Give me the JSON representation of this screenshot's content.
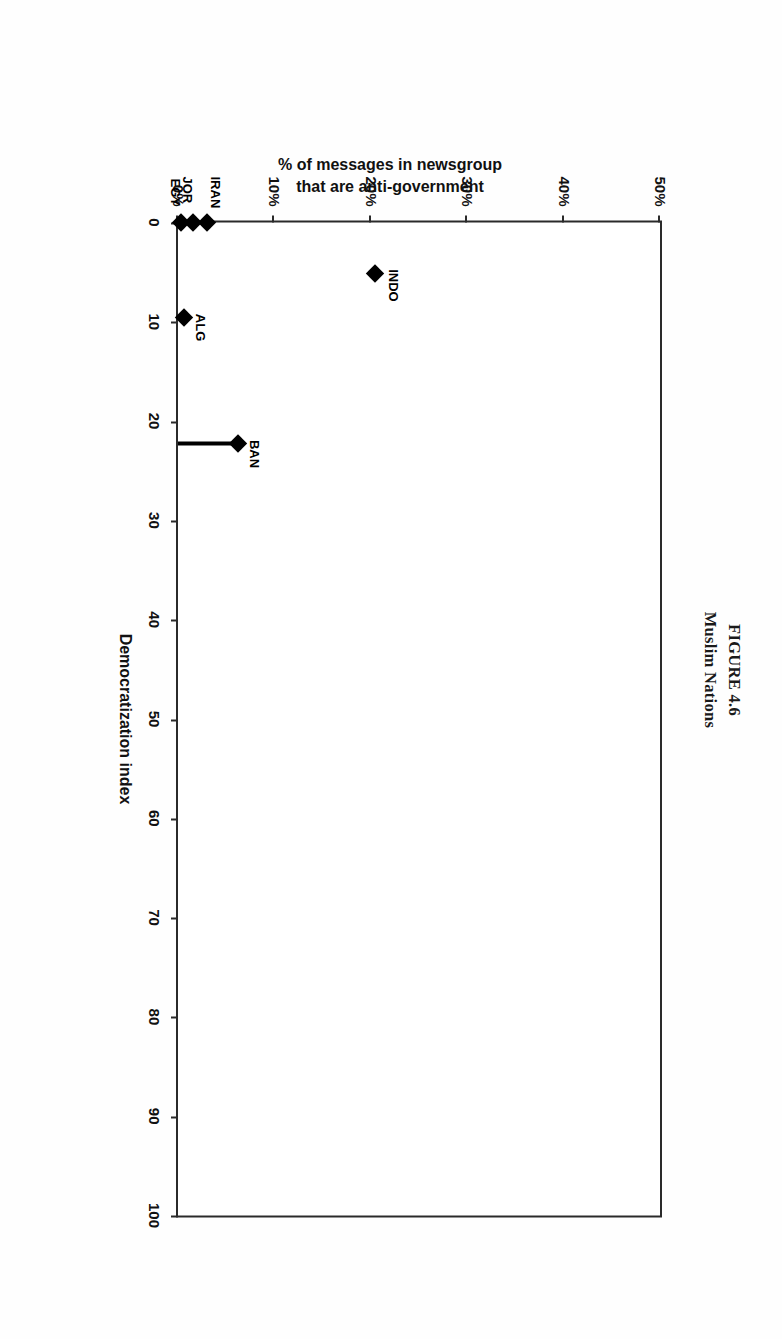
{
  "figure": {
    "number_line": "FIGURE 4.6",
    "caption_line": "Muslim Nations"
  },
  "chart_data": {
    "type": "scatter",
    "title": "FIGURE 4.6 Muslim Nations",
    "xlabel": "Democratization index",
    "ylabel": "% of messages in newsgroup that are anti-government",
    "ylabel_line1": "% of messages in newsgroup",
    "ylabel_line2": "that are anti-government",
    "xlim": [
      0,
      100
    ],
    "ylim": [
      0,
      50
    ],
    "xticks": [
      0,
      10,
      20,
      30,
      40,
      50,
      60,
      70,
      80,
      90,
      100
    ],
    "xtick_labels": [
      "0",
      "10",
      "20",
      "30",
      "40",
      "50",
      "60",
      "70",
      "80",
      "90",
      "100"
    ],
    "yticks": [
      0,
      10,
      20,
      30,
      40,
      50
    ],
    "ytick_labels": [
      "0%",
      "10%",
      "20%",
      "30%",
      "40%",
      "50%"
    ],
    "grid": false,
    "legend": "none",
    "marker_shape": "diamond",
    "marker_color": "#000000",
    "line_color": "#000000",
    "points": [
      {
        "label": "EGY",
        "x": 0,
        "y": 0.3,
        "label_dx": -44,
        "label_dy": -2
      },
      {
        "label": "JOR",
        "x": 0,
        "y": 1.6,
        "label_dx": -46,
        "label_dy": -2
      },
      {
        "label": "IRAN",
        "x": 0,
        "y": 3.0,
        "label_dx": -46,
        "label_dy": -16
      },
      {
        "label": "BAN",
        "x": 22.3,
        "y": 6.2,
        "label_dx": -4,
        "label_dy": -24
      },
      {
        "label": "ALG",
        "x": 9.6,
        "y": 0.6,
        "label_dx": -4,
        "label_dy": -24
      },
      {
        "label": "INDO",
        "x": 5.1,
        "y": 20.4,
        "label_dx": -4,
        "label_dy": -26
      }
    ],
    "connector": {
      "description": "vertical line from BAN marker down to baseline",
      "x": 22.3,
      "y_from": 6.2,
      "y_to": 0
    }
  }
}
